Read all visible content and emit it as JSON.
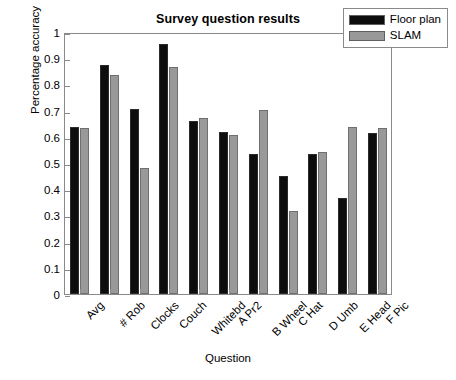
{
  "chart_data": {
    "type": "bar",
    "title": "Survey question results",
    "xlabel": "Question",
    "ylabel": "Percentage accuracy",
    "ylim": [
      0,
      1
    ],
    "yticks": [
      "0",
      "0.1",
      "0.2",
      "0.3",
      "0.4",
      "0.5",
      "0.6",
      "0.7",
      "0.8",
      "0.9",
      "1"
    ],
    "ytick_values": [
      0,
      0.1,
      0.2,
      0.3,
      0.4,
      0.5,
      0.6,
      0.7,
      0.8,
      0.9,
      1
    ],
    "grid": false,
    "legend_position": "top-right",
    "categories": [
      "Avg",
      "# Rob",
      "Clocks",
      "Couch",
      "Whitebd",
      "A Pr2",
      "B Wheel",
      "C Hat",
      "D Umb",
      "E Head",
      "F Pic"
    ],
    "series": [
      {
        "name": "Floor plan",
        "color": "#0d0d0d",
        "values": [
          0.637,
          0.874,
          0.705,
          0.954,
          0.66,
          0.618,
          0.536,
          0.451,
          0.535,
          0.365,
          0.615
        ]
      },
      {
        "name": "SLAM",
        "color": "#999999",
        "values": [
          0.635,
          0.836,
          0.482,
          0.866,
          0.671,
          0.607,
          0.702,
          0.316,
          0.541,
          0.636,
          0.634
        ]
      }
    ]
  }
}
